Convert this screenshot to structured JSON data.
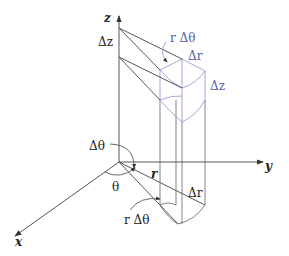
{
  "diagram": {
    "colors": {
      "black": "#333333",
      "blue": "#8a90c8",
      "blue_text": "#5560b0"
    },
    "axes": {
      "x": "x",
      "y": "y",
      "z": "z"
    },
    "labels": {
      "dz_axis": "Δz",
      "r_dtheta_top": "r Δθ",
      "dr_top": "Δr",
      "dz_block": "Δz",
      "dtheta": "Δθ",
      "theta": "θ",
      "r": "r",
      "dr_bottom": "Δr",
      "r_dtheta_bottom": "r Δθ"
    }
  }
}
